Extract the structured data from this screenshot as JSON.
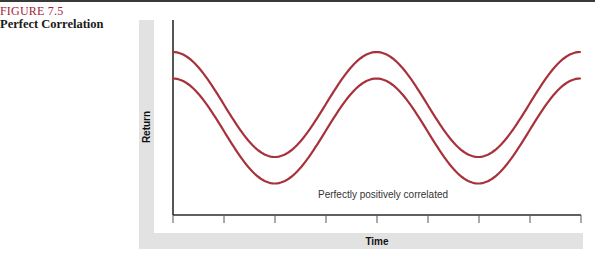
{
  "figure": {
    "number": "FIGURE 7.5",
    "title": "Perfect Correlation"
  },
  "colors": {
    "figure_number": "#a3243b",
    "series": "#a8323c",
    "axis": "#2b2b2b",
    "axis_band": "#e2e2e2"
  },
  "chart_data": {
    "type": "line",
    "title": "Perfect Correlation",
    "xlabel": "Time",
    "ylabel": "Return",
    "annotation": "Perfectly positively correlated",
    "grid": false,
    "legend": null,
    "x_ticks": 9,
    "x_tick_labels": [],
    "y_tick_labels": [],
    "x": [
      0,
      0.5,
      1,
      1.5,
      2,
      2.5,
      3,
      3.5,
      4
    ],
    "series": [
      {
        "name": "Asset A (upper)",
        "shape": "cosine",
        "periods": 2,
        "values": [
          1.0,
          0.0,
          -1.0,
          0.0,
          1.0,
          0.0,
          -1.0,
          0.0,
          1.0
        ],
        "offset": 0.5
      },
      {
        "name": "Asset B (lower)",
        "shape": "cosine",
        "periods": 2,
        "values": [
          1.0,
          0.0,
          -1.0,
          0.0,
          1.0,
          0.0,
          -1.0,
          0.0,
          1.0
        ],
        "offset": 0.0
      }
    ],
    "correlation": 1.0
  }
}
